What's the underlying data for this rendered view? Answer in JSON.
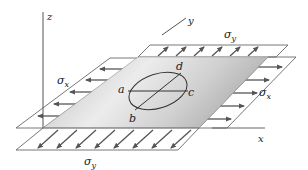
{
  "figure": {
    "axes": {
      "z": "z",
      "y": "y",
      "x": "x"
    },
    "stress_labels": {
      "sigma_x_left": "σx",
      "sigma_x_right": "σx",
      "sigma_y_top": "σy",
      "sigma_y_bottom": "σy",
      "sigma_symbol": "σ",
      "sub_x": "x",
      "sub_y": "y"
    },
    "points": {
      "a": "a",
      "b": "b",
      "c": "c",
      "d": "d"
    },
    "colors": {
      "plate_light": "#f2f2f2",
      "plate_dark": "#b8b8b8",
      "lines": "#555555",
      "text": "#222222"
    }
  }
}
